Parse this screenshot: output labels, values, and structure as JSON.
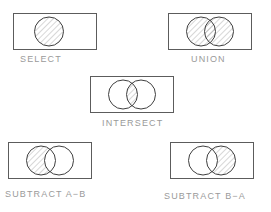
{
  "figure": {
    "background_color": "#ffffff",
    "stroke_color": "#5c5c5c",
    "circle_stroke_color": "#3f3f3f",
    "hatch_color": "#8c8c8c",
    "caption_color": "#9a9a9a"
  },
  "panels": [
    {
      "id": "select",
      "caption": "SELECT",
      "operation": "select",
      "circle_count": 1,
      "shaded_regions": [
        "circle-a"
      ],
      "box": {
        "width": 84,
        "height": 37
      }
    },
    {
      "id": "union",
      "caption": "UNION",
      "operation": "union",
      "circle_count": 2,
      "shaded_regions": [
        "circle-a",
        "overlap",
        "circle-b"
      ],
      "box": {
        "width": 84,
        "height": 37
      }
    },
    {
      "id": "intersect",
      "caption": "INTERSECT",
      "operation": "intersect",
      "circle_count": 2,
      "shaded_regions": [
        "overlap"
      ],
      "box": {
        "width": 84,
        "height": 37
      }
    },
    {
      "id": "subtract-ab",
      "caption": "SUBTRACT A−B",
      "operation": "subtract-a-minus-b",
      "circle_count": 2,
      "shaded_regions": [
        "circle-a-only"
      ],
      "box": {
        "width": 84,
        "height": 37
      }
    },
    {
      "id": "subtract-ba",
      "caption": "SUBTRACT B−A",
      "operation": "subtract-b-minus-a",
      "circle_count": 2,
      "shaded_regions": [
        "circle-b-only"
      ],
      "box": {
        "width": 84,
        "height": 37
      }
    }
  ]
}
